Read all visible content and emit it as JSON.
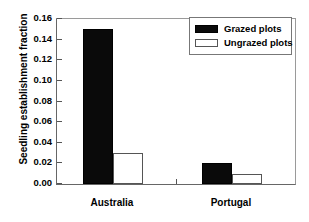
{
  "chart_data": {
    "type": "bar",
    "title": "",
    "xlabel": "",
    "ylabel": "Seedling establishment fraction",
    "categories": [
      "Australia",
      "Portugal"
    ],
    "series": [
      {
        "name": "Grazed plots",
        "values": [
          0.15,
          0.02
        ],
        "color": "#000000",
        "fill": "solid"
      },
      {
        "name": "Ungrazed plots",
        "values": [
          0.03,
          0.01
        ],
        "color": "#ffffff",
        "fill": "hollow"
      }
    ],
    "ylim": [
      0.0,
      0.16
    ],
    "yticks": [
      "0.00",
      "0.02",
      "0.04",
      "0.06",
      "0.08",
      "0.10",
      "0.12",
      "0.14",
      "0.16"
    ],
    "ytick_values": [
      0.0,
      0.02,
      0.04,
      0.06,
      0.08,
      0.1,
      0.12,
      0.14,
      0.16
    ],
    "grid": false,
    "legend_position": "top-right"
  },
  "axes": {
    "y_title": "Seedling establishment fraction"
  },
  "legend": {
    "entries": [
      {
        "label": "Grazed plots"
      },
      {
        "label": "Ungrazed plots"
      }
    ]
  }
}
